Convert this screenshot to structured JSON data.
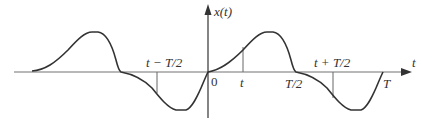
{
  "diagram": {
    "axes": {
      "x_label": "t",
      "y_label": "x(t)",
      "origin_label": "0"
    },
    "tick_labels": {
      "t_minus_half": "t − T/2",
      "t": "t",
      "half_period": "T/2",
      "t_plus_half": "t + T/2",
      "period": "T"
    },
    "colors": {
      "curve": "#333333",
      "axis": "#999999",
      "marker": "#666666"
    }
  }
}
